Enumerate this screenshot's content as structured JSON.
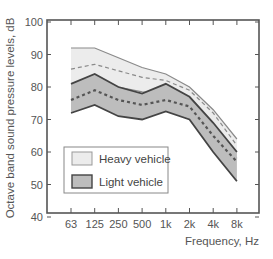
{
  "chart_data": {
    "type": "area",
    "title": "",
    "xlabel": "Frequency, Hz",
    "ylabel": "Octave band sound pressure levels, dB",
    "categories": [
      "63",
      "125",
      "250",
      "500",
      "1k",
      "2k",
      "4k",
      "8k"
    ],
    "ylim": [
      40,
      100
    ],
    "yticks": [
      40,
      50,
      60,
      70,
      80,
      90,
      100
    ],
    "grid": false,
    "legend_position": "inside lower left",
    "series": [
      {
        "name": "Heavy vehicle",
        "kind": "range_band_with_mean",
        "fill": "#ececec",
        "upper": [
          92,
          92,
          89,
          86,
          84,
          80,
          73,
          64
        ],
        "mean": [
          85.5,
          87,
          85,
          83,
          82,
          79,
          72,
          62
        ],
        "lower": [
          81,
          82.5,
          80,
          78.5,
          77.5,
          75,
          67,
          58
        ]
      },
      {
        "name": "Light vehicle",
        "kind": "range_band_with_mean",
        "fill": "#bdbdbd",
        "upper": [
          81,
          84,
          80,
          78,
          81,
          77,
          69,
          60
        ],
        "mean": [
          76,
          79,
          76,
          74.5,
          76,
          74,
          65,
          57
        ],
        "lower": [
          72,
          74.5,
          71,
          70,
          72.5,
          70,
          60,
          51
        ]
      }
    ]
  },
  "legend": {
    "items": [
      {
        "label": "Heavy vehicle",
        "swatch": "#ececec"
      },
      {
        "label": "Light vehicle",
        "swatch": "#bdbdbd"
      }
    ]
  },
  "axes": {
    "x_title": "Frequency, Hz",
    "y_title": "Octave band sound pressure levels, dB"
  }
}
